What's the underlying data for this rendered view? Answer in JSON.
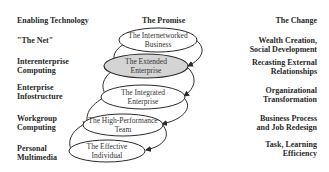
{
  "headers": {
    "left": "Enabling Technology",
    "center": "The Promise",
    "right": "The Change"
  },
  "rows": [
    {
      "technology": [
        "\"The Net\""
      ],
      "promise": [
        "The Internetworked",
        "Business"
      ],
      "change": [
        "Wealth Creation,",
        "Social Development"
      ],
      "highlighted": false
    },
    {
      "technology": [
        "Interenterprise",
        "Computing"
      ],
      "promise": [
        "The Extended",
        "Enterprise"
      ],
      "change": [
        "Recasting External",
        "Relationships"
      ],
      "highlighted": true
    },
    {
      "technology": [
        "Enterprise",
        "Infostructure"
      ],
      "promise": [
        "The Integrated",
        "Enterprise"
      ],
      "change": [
        "Organizational",
        "Transformation"
      ],
      "highlighted": false
    },
    {
      "technology": [
        "Workgroup",
        "Computing"
      ],
      "promise": [
        "The High-Performance",
        "Team"
      ],
      "change": [
        "Business Process",
        "and Job Redesign"
      ],
      "highlighted": false
    },
    {
      "technology": [
        "Personal",
        "Multimedia"
      ],
      "promise": [
        "The Effective",
        "Individual"
      ],
      "change": [
        "Task, Learning",
        "Efficiency"
      ],
      "highlighted": false
    }
  ],
  "colors": {
    "highlight_fill": "#d4d4d4",
    "ellipse_stroke": "#2a2a2a",
    "background": "#ffffff"
  }
}
